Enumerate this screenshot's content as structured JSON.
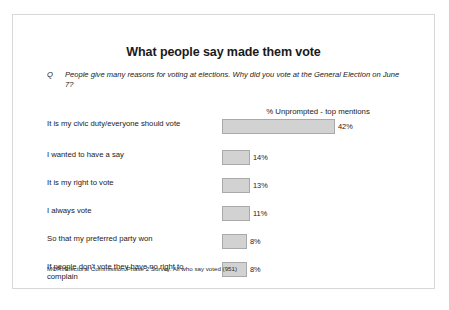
{
  "slide": {
    "title": "What people say made them vote",
    "question_marker": "Q",
    "question_text": "People give many reasons for voting at elections. Why did you vote at the General Election on June 7?",
    "chart_header": "% Unprompted - top mentions",
    "footnote": "MORI/Electoral Commission Phase 2 Survey. All who say voted (951)"
  },
  "colors": {
    "bar_fill": "#d2d2d2",
    "bar_border": "#a9a9a9",
    "slide_border": "#d8d8d8",
    "text": "#1a1a1a"
  },
  "chart_data": {
    "type": "bar",
    "orientation": "horizontal",
    "title": "What people say made them vote",
    "subtitle": "% Unprompted - top mentions",
    "xlabel": "",
    "ylabel": "",
    "xlim": [
      0,
      42
    ],
    "grid": false,
    "legend": false,
    "categories": [
      "It is my civic duty/everyone should vote",
      "I wanted to have a say",
      "It is my right to vote",
      "I always vote",
      "So that my preferred party won",
      "If people don't vote they have no right to complain"
    ],
    "values": [
      42,
      14,
      13,
      11,
      8,
      8
    ],
    "value_labels": [
      "42%",
      "14%",
      "13%",
      "11%",
      "8%",
      "8%"
    ],
    "bar_pixel_widths": [
      113,
      28,
      28,
      28,
      25,
      25
    ],
    "source": "MORI/Electoral Commission Phase 2 Survey. All who say voted (951)"
  },
  "rows": [
    {
      "label": "It is my civic duty/everyone should vote",
      "value_label": "42%",
      "width": 113
    },
    {
      "label": "I wanted to have a say",
      "value_label": "14%",
      "width": 28
    },
    {
      "label": "It is my right to vote",
      "value_label": "13%",
      "width": 28
    },
    {
      "label": "I always vote",
      "value_label": "11%",
      "width": 28
    },
    {
      "label": "So that my preferred party won",
      "value_label": "8%",
      "width": 25
    },
    {
      "label": "If people don't vote they have no right to complain",
      "value_label": "8%",
      "width": 25
    }
  ]
}
